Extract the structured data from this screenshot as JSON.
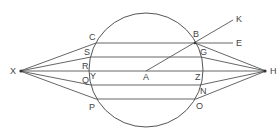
{
  "diagram": {
    "type": "geometric-optics-construction",
    "circle": {
      "center_label": "A"
    },
    "labels": {
      "X": "X",
      "H": "H",
      "A": "A",
      "B": "B",
      "C": "C",
      "S": "S",
      "R": "R",
      "Q": "Q",
      "P": "P",
      "Y": "Y",
      "Z": "Z",
      "G": "G",
      "N": "N",
      "O": "O",
      "K": "K",
      "E": "E"
    },
    "stroke_color": "#555555",
    "label_color": "#444444"
  }
}
